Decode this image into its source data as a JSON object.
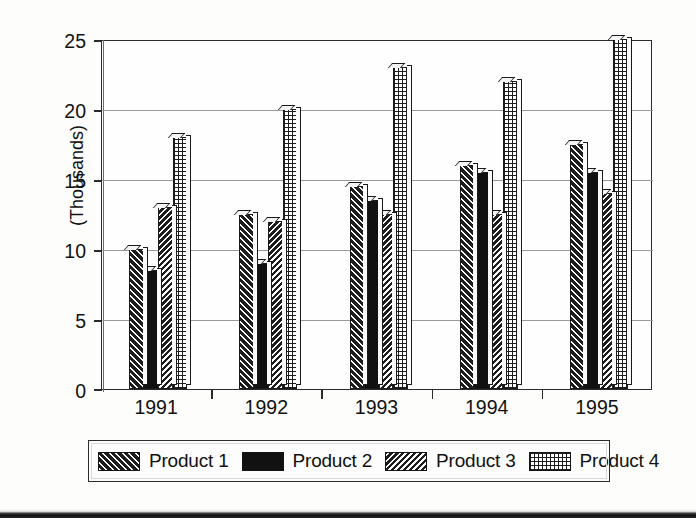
{
  "chart_data": {
    "type": "bar",
    "title": "",
    "xlabel": "",
    "ylabel": "(Thousands)",
    "categories": [
      "1991",
      "1992",
      "1993",
      "1994",
      "1995"
    ],
    "series": [
      {
        "name": "Product 1",
        "pattern": "diagonal-hatch-left",
        "values": [
          10,
          12.5,
          14.5,
          16,
          17.5
        ]
      },
      {
        "name": "Product 2",
        "pattern": "solid-black",
        "values": [
          8.5,
          9,
          13.5,
          15.5,
          15.5
        ]
      },
      {
        "name": "Product 3",
        "pattern": "diagonal-hatch-right",
        "values": [
          13,
          12,
          12.5,
          12.5,
          14
        ]
      },
      {
        "name": "Product 4",
        "pattern": "crosshatch-grid",
        "values": [
          18,
          20,
          23,
          22,
          25
        ]
      }
    ],
    "ylim": [
      0,
      25
    ],
    "yticks": [
      0,
      5,
      10,
      15,
      20,
      25
    ],
    "ytick_labels": [
      "0",
      "5",
      "10",
      "15",
      "20",
      "25"
    ],
    "grid": true,
    "legend_position": "bottom"
  },
  "legend": {
    "entries": [
      {
        "label": "Product 1"
      },
      {
        "label": "Product 2"
      },
      {
        "label": "Product 3"
      },
      {
        "label": "Product 4"
      }
    ]
  }
}
